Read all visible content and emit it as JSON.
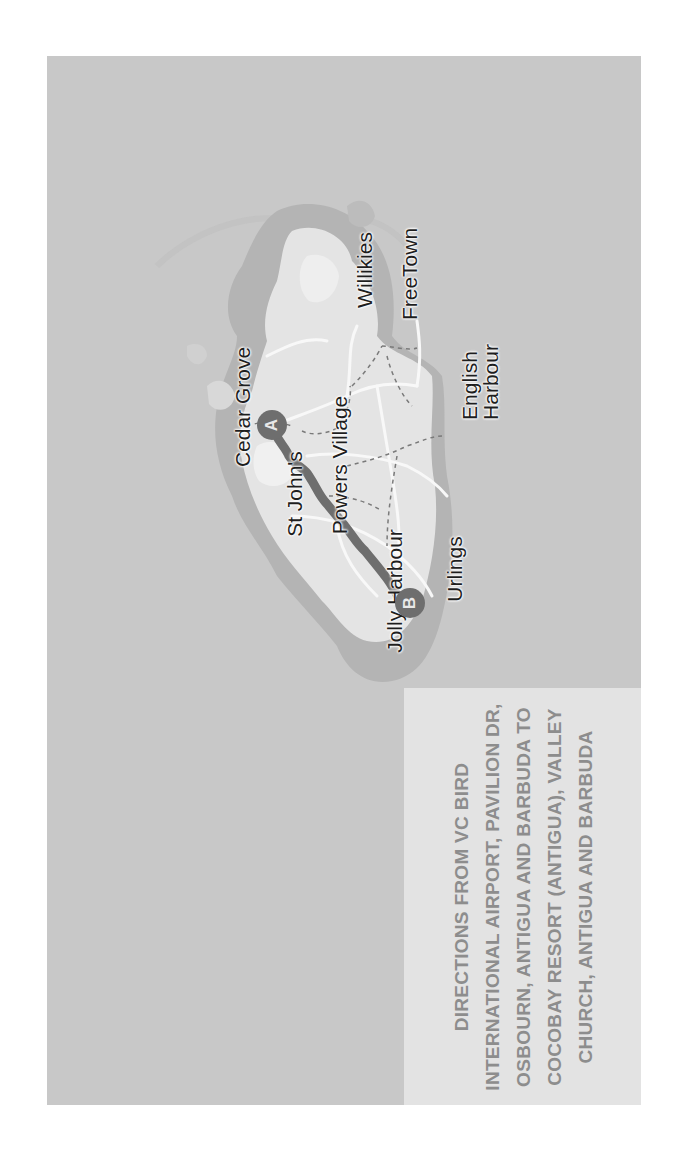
{
  "map": {
    "orientation": "rotated 90 degrees counter-clockwise",
    "colors": {
      "sea": "#c8c8c8",
      "land_outer": "#b3b3b3",
      "land_inner": "#e6e6e6",
      "roads": "#f7f7f7",
      "route": "#6e6e6e",
      "caption_bg": "#e3e3e3",
      "caption_text": "#8d8d8d"
    },
    "places": [
      {
        "name": "Cedar Grove"
      },
      {
        "name": "St John's"
      },
      {
        "name": "Powers Village"
      },
      {
        "name": "Jolly Harbour"
      },
      {
        "name": "Urlings"
      },
      {
        "name": "English Harbour",
        "line1": "English",
        "line2": "Harbour"
      },
      {
        "name": "Willikies"
      },
      {
        "name": "FreeTown"
      }
    ],
    "markers": {
      "start": {
        "letter": "A"
      },
      "end": {
        "letter": "B"
      }
    }
  },
  "caption": {
    "text": "DIRECTIONS FROM VC BIRD INTERNATIONAL AIRPORT, PAVILION DR, OSBOURN, ANTIGUA AND BARBUDA TO COCOBAY RESORT (ANTIGUA), VALLEY CHURCH, ANTIGUA AND BARBUDA"
  }
}
